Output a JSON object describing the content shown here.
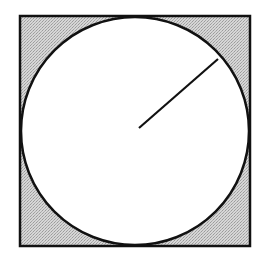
{
  "diagram": {
    "title": "",
    "canvas": {
      "width": 260,
      "height": 254
    },
    "square": {
      "x": 20,
      "y": 16,
      "size": 230,
      "stroke": "#111111",
      "stroke_width": 2.5,
      "fill": "#c9c9c9"
    },
    "circle": {
      "cx": 135,
      "cy": 131,
      "r": 114,
      "stroke": "#111111",
      "stroke_width": 2.5,
      "fill": "#ffffff"
    },
    "radius_line": {
      "x1": 139,
      "y1": 128,
      "x2": 218,
      "y2": 59,
      "stroke": "#111111",
      "stroke_width": 2.2
    },
    "shading": {
      "pattern": "stipple",
      "base": "#d6d6d6",
      "dot": "#9a9a9a"
    }
  }
}
